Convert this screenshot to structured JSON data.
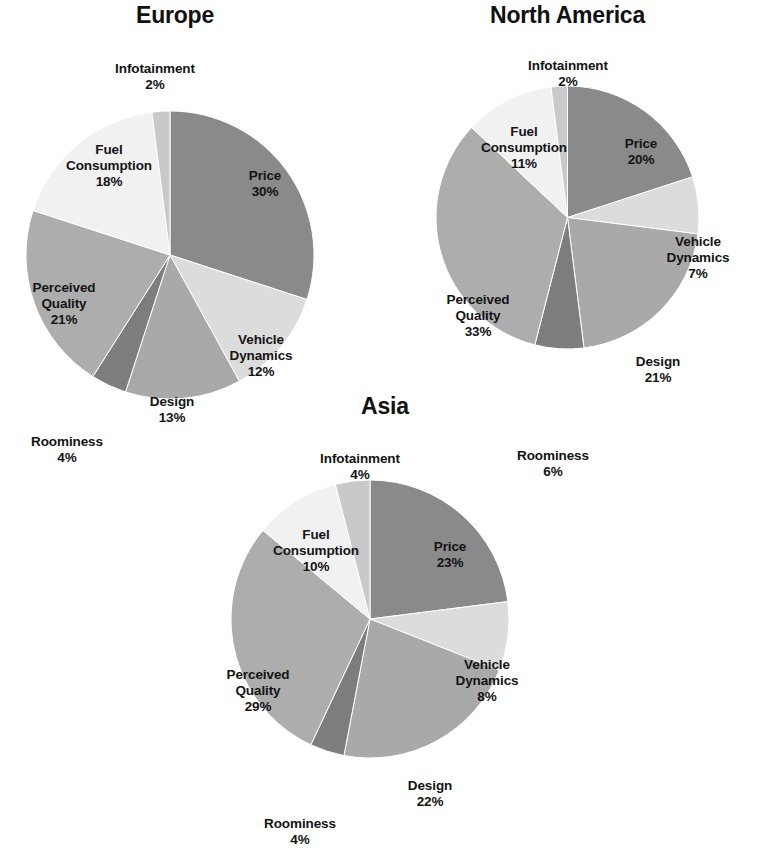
{
  "chart_data": [
    {
      "type": "pie",
      "title": "Europe",
      "categories": [
        "Price",
        "Vehicle Dynamics",
        "Design",
        "Roominess",
        "Perceived Quality",
        "Fuel Consumption",
        "Infotainment"
      ],
      "values": [
        30,
        12,
        13,
        4,
        21,
        18,
        2
      ],
      "value_labels": [
        "30%",
        "12%",
        "13%",
        "4%",
        "21%",
        "18%",
        "2%"
      ],
      "unit": "%",
      "start_angle_deg": 0,
      "direction": "clockwise",
      "legend": "none",
      "grid": false
    },
    {
      "type": "pie",
      "title": "North America",
      "categories": [
        "Price",
        "Vehicle Dynamics",
        "Design",
        "Roominess",
        "Perceived Quality",
        "Fuel Consumption",
        "Infotainment"
      ],
      "values": [
        20,
        7,
        21,
        6,
        33,
        11,
        2
      ],
      "value_labels": [
        "20%",
        "7%",
        "21%",
        "6%",
        "33%",
        "11%",
        "2%"
      ],
      "unit": "%",
      "start_angle_deg": 0,
      "direction": "clockwise",
      "legend": "none",
      "grid": false
    },
    {
      "type": "pie",
      "title": "Asia",
      "categories": [
        "Price",
        "Vehicle Dynamics",
        "Design",
        "Roominess",
        "Perceived Quality",
        "Fuel Consumption",
        "Infotainment"
      ],
      "values": [
        23,
        8,
        22,
        4,
        29,
        10,
        4
      ],
      "value_labels": [
        "23%",
        "8%",
        "22%",
        "4%",
        "29%",
        "10%",
        "4%"
      ],
      "unit": "%",
      "start_angle_deg": 0,
      "direction": "clockwise",
      "legend": "none",
      "grid": false
    }
  ],
  "palette": {
    "price": "#8a8a8a",
    "vehicle_dynamics": "#dcdcdc",
    "design": "#a9a9a9",
    "roominess": "#7d7d7d",
    "perceived_quality": "#adadad",
    "fuel_consumption": "#f1f1f1",
    "infotainment": "#c9c9c9",
    "background": "#ffffff",
    "text": "#141414"
  },
  "europe": {
    "title": "Europe",
    "labels": {
      "price": {
        "name": "Price",
        "pct": "30%"
      },
      "vehicle_dynamics": {
        "name": "Vehicle\nDynamics",
        "pct": "12%"
      },
      "design": {
        "name": "Design",
        "pct": "13%"
      },
      "roominess": {
        "name": "Roominess",
        "pct": "4%"
      },
      "perceived_quality": {
        "name": "Perceived\nQuality",
        "pct": "21%"
      },
      "fuel_consumption": {
        "name": "Fuel\nConsumption",
        "pct": "18%"
      },
      "infotainment": {
        "name": "Infotainment",
        "pct": "2%"
      }
    }
  },
  "north_america": {
    "title": "North America",
    "labels": {
      "price": {
        "name": "Price",
        "pct": "20%"
      },
      "vehicle_dynamics": {
        "name": "Vehicle\nDynamics",
        "pct": "7%"
      },
      "design": {
        "name": "Design",
        "pct": "21%"
      },
      "roominess": {
        "name": "Roominess",
        "pct": "6%"
      },
      "perceived_quality": {
        "name": "Perceived\nQuality",
        "pct": "33%"
      },
      "fuel_consumption": {
        "name": "Fuel\nConsumption",
        "pct": "11%"
      },
      "infotainment": {
        "name": "Infotainment",
        "pct": "2%"
      }
    }
  },
  "asia": {
    "title": "Asia",
    "labels": {
      "price": {
        "name": "Price",
        "pct": "23%"
      },
      "vehicle_dynamics": {
        "name": "Vehicle\nDynamics",
        "pct": "8%"
      },
      "design": {
        "name": "Design",
        "pct": "22%"
      },
      "roominess": {
        "name": "Roominess",
        "pct": "4%"
      },
      "perceived_quality": {
        "name": "Perceived\nQuality",
        "pct": "29%"
      },
      "fuel_consumption": {
        "name": "Fuel\nConsumption",
        "pct": "10%"
      },
      "infotainment": {
        "name": "Infotainment",
        "pct": "4%"
      }
    }
  }
}
